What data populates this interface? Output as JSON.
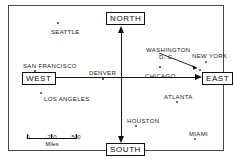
{
  "figure": {
    "type": "schematic-map"
  },
  "directions": {
    "north": "NORTH",
    "south": "SOUTH",
    "west": "WEST",
    "east": "EAST"
  },
  "cities": [
    {
      "name": "SEATTLE",
      "x": 42,
      "y": 23,
      "dot_x": 48,
      "dot_y": 16,
      "filled": false,
      "align": "center"
    },
    {
      "name": "SAN FRANCISCO",
      "x": 14,
      "y": 57,
      "dot_x": 25,
      "dot_y": 64,
      "filled": true,
      "align": "left"
    },
    {
      "name": "LOS ANGELES",
      "x": 35,
      "y": 90,
      "dot_x": 31,
      "dot_y": 86,
      "filled": false,
      "align": "left"
    },
    {
      "name": "DENVER",
      "x": 80,
      "y": 64,
      "dot_x": 93,
      "dot_y": 72,
      "filled": true,
      "align": "left"
    },
    {
      "name": "CHICAGO",
      "x": 136,
      "y": 67,
      "dot_x": 150,
      "dot_y": 60,
      "filled": true,
      "align": "left"
    },
    {
      "name": "WASHINGTON",
      "x": 137,
      "y": 41,
      "dot_x": 0,
      "dot_y": 0,
      "filled": false,
      "align": "left"
    },
    {
      "name": "D. C.",
      "x": 150,
      "y": 48,
      "dot_x": 0,
      "dot_y": 0,
      "filled": false,
      "align": "left"
    },
    {
      "name": "NEW YORK",
      "x": 183,
      "y": 47,
      "dot_x": 196,
      "dot_y": 55,
      "filled": false,
      "align": "left"
    },
    {
      "name": "ATLANTA",
      "x": 155,
      "y": 88,
      "dot_x": 167,
      "dot_y": 95,
      "filled": false,
      "align": "left"
    },
    {
      "name": "HOUSTON",
      "x": 118,
      "y": 112,
      "dot_x": 126,
      "dot_y": 119,
      "filled": false,
      "align": "left"
    },
    {
      "name": "MIAMI",
      "x": 180,
      "y": 125,
      "dot_x": 185,
      "dot_y": 132,
      "filled": false,
      "align": "left"
    }
  ],
  "dc_marker": {
    "label": "washington-dc-pointer",
    "dot_x": 190,
    "dot_y": 63
  },
  "scale": {
    "ticks": [
      "0",
      "250",
      "500"
    ],
    "unit": "Miles"
  },
  "colors": {
    "ink": "#111111",
    "frame": "#4a4a4a",
    "background": "#ffffff"
  }
}
